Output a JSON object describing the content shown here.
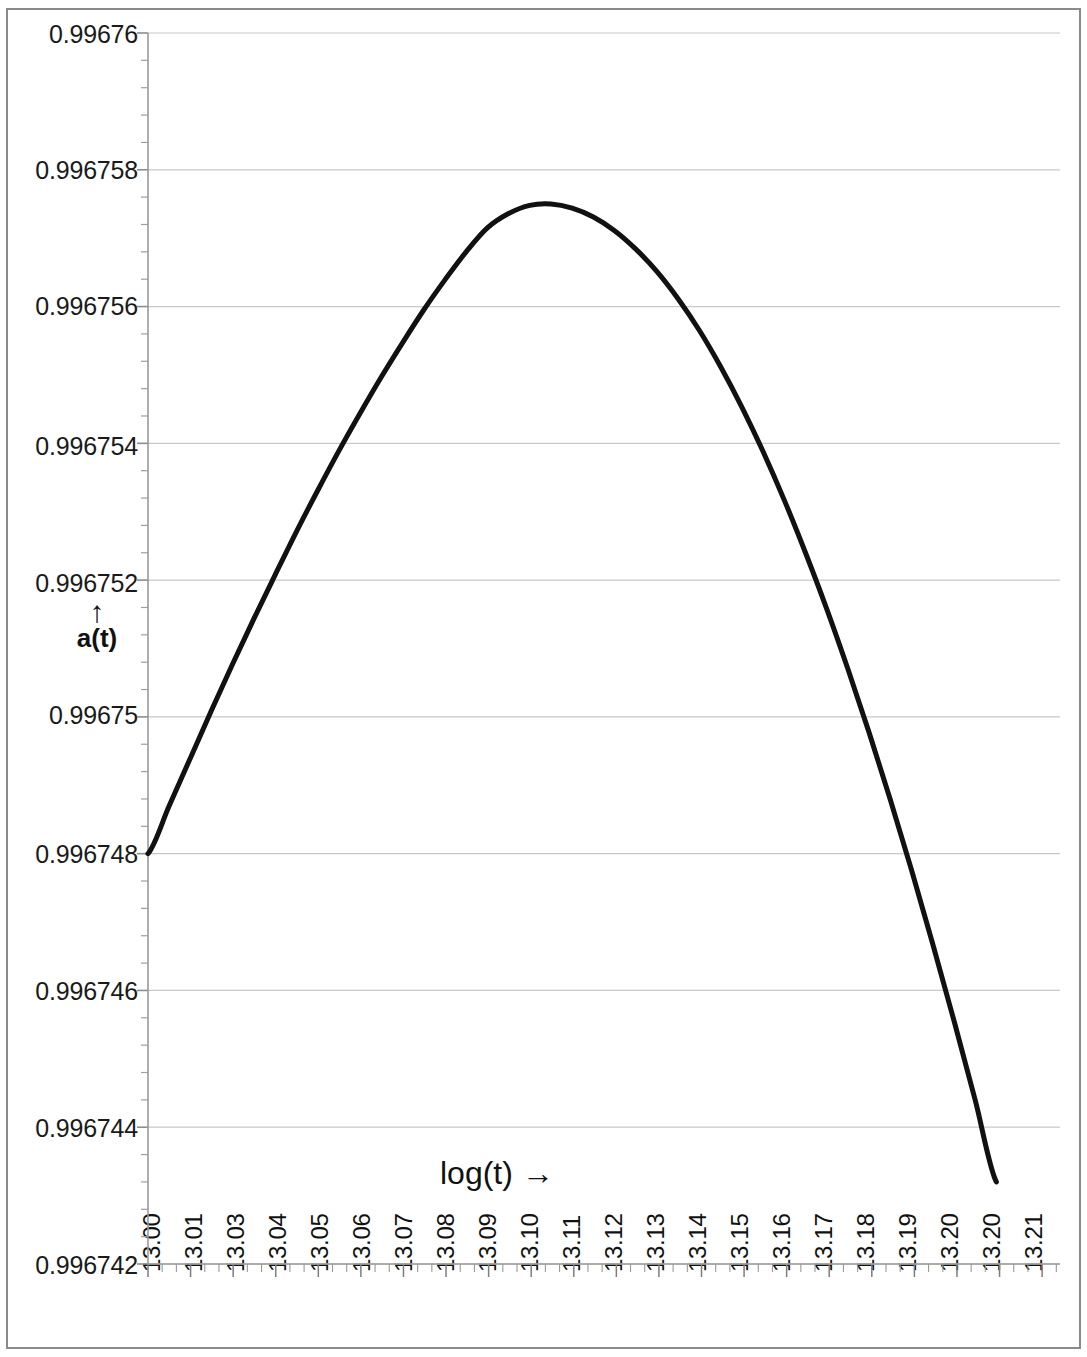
{
  "chart_data": {
    "type": "line",
    "title": "",
    "subtitle": "",
    "xlabel": "log(t) →",
    "ylabel": "a(t)",
    "ylabel_arrow": "↑",
    "grid": true,
    "legend": null,
    "xlim": [
      13.0,
      13.215
    ],
    "ylim": [
      0.996742,
      0.99676
    ],
    "y_ticklabels": [
      "0.99676",
      "0.996758",
      "0.996756",
      "0.996754",
      "0.996752",
      "0.99675",
      "0.996748",
      "0.996746",
      "0.996744",
      "0.996742"
    ],
    "y_tickvalues": [
      0.99676,
      0.996758,
      0.996756,
      0.996754,
      0.996752,
      0.99675,
      0.996748,
      0.996746,
      0.996744,
      0.996742
    ],
    "y_minor_ticks_per_major": 5,
    "x_ticklabels": [
      "13.00",
      "13.01",
      "13.03",
      "13.04",
      "13.05",
      "13.06",
      "13.07",
      "13.08",
      "13.09",
      "13.10",
      "13.11",
      "13.12",
      "13.13",
      "13.14",
      "13.15",
      "13.16",
      "13.17",
      "13.18",
      "13.19",
      "13.20",
      "13.20",
      "13.21"
    ],
    "x_minor_ticks_per_major": 3,
    "series": [
      {
        "name": "a(t)",
        "color": "#111111",
        "linewidth": 5,
        "x": [
          13.0,
          13.005,
          13.01,
          13.015,
          13.02,
          13.025,
          13.03,
          13.035,
          13.04,
          13.045,
          13.05,
          13.055,
          13.06,
          13.065,
          13.07,
          13.075,
          13.08,
          13.085,
          13.09,
          13.095,
          13.1,
          13.105,
          13.11,
          13.115,
          13.12,
          13.125,
          13.13,
          13.135,
          13.14,
          13.145,
          13.15,
          13.155,
          13.16,
          13.165,
          13.17,
          13.175,
          13.18,
          13.185,
          13.19,
          13.195,
          13.2
        ],
        "y": [
          0.996748,
          0.9967487,
          0.9967494,
          0.9967501,
          0.99675078,
          0.99675144,
          0.99675208,
          0.99675271,
          0.99675331,
          0.99675389,
          0.99675444,
          0.99675497,
          0.99675547,
          0.99675595,
          0.99675639,
          0.9967568,
          0.99675715,
          0.99675736,
          0.99675748,
          0.9967575,
          0.99675744,
          0.99675731,
          0.99675711,
          0.99675684,
          0.99675651,
          0.99675611,
          0.99675565,
          0.99675512,
          0.99675453,
          0.99675388,
          0.99675317,
          0.9967524,
          0.99675158,
          0.9967507,
          0.99674977,
          0.99674879,
          0.99674776,
          0.99674668,
          0.99674556,
          0.9967444,
          0.9967432
        ],
        "peak_x": 13.12,
        "peak_y": 0.99675744,
        "start_point": [
          13.0,
          0.996748
        ],
        "end_point": [
          13.214,
          0.9967511
        ]
      }
    ],
    "annotations": []
  },
  "axes": {
    "x_axis_name": "log(t)",
    "y_axis_name": "a(t)"
  }
}
